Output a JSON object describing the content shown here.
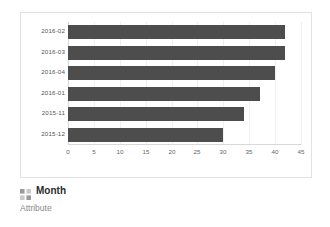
{
  "chart_data": {
    "type": "bar",
    "orientation": "horizontal",
    "title": "",
    "xlabel": "",
    "ylabel": "",
    "categories": [
      "2016-02",
      "2016-03",
      "2016-04",
      "2016-01",
      "2015-11",
      "2015-12"
    ],
    "values": [
      42,
      42,
      40,
      37,
      34,
      30
    ],
    "xlim": [
      0,
      45
    ],
    "xticks": [
      0,
      5,
      10,
      15,
      20,
      25,
      30,
      35,
      40,
      45
    ],
    "xticklabels": [
      "0",
      "5",
      "10",
      "15",
      "20",
      "25",
      "30",
      "35",
      "40",
      "45"
    ],
    "grid": true,
    "legend": false,
    "series_color": "#4d4d4d"
  },
  "footer": {
    "icon": "grid-table-icon",
    "title": "Month",
    "subtitle": "Attribute"
  },
  "colors": {
    "bar": "#4d4d4d",
    "card_border": "#e2e2e2",
    "gridline": "#f0f0f0",
    "axis": "#d8d8d8",
    "tick_text": "#666666",
    "category_text": "#555555",
    "title_text": "#2b2b2b",
    "subtitle_text": "#8a8a8a"
  }
}
